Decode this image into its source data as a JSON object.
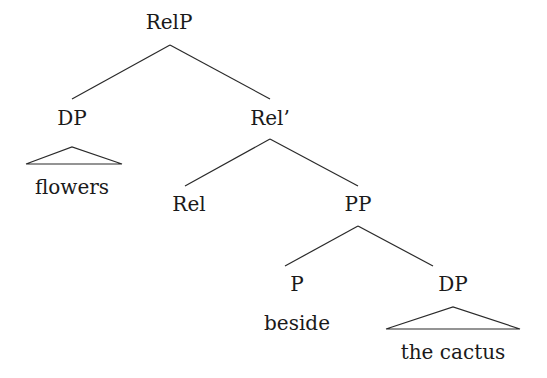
{
  "diagram": {
    "type": "syntax-tree",
    "root": {
      "label": "RelP",
      "children": [
        {
          "label": "DP",
          "triangle": true,
          "terminal": "flowers"
        },
        {
          "label": "Rel'",
          "children": [
            {
              "label": "Rel"
            },
            {
              "label": "PP",
              "children": [
                {
                  "label": "P",
                  "terminal": "beside"
                },
                {
                  "label": "DP",
                  "triangle": true,
                  "terminal": "the cactus"
                }
              ]
            }
          ]
        }
      ]
    },
    "nodes": {
      "relp": "RelP",
      "dp1": "DP",
      "dp1_terminal": "flowers",
      "relbar": "Rel’",
      "rel": "Rel",
      "pp": "PP",
      "p": "P",
      "p_terminal": "beside",
      "dp2": "DP",
      "dp2_terminal": "the cactus"
    }
  }
}
